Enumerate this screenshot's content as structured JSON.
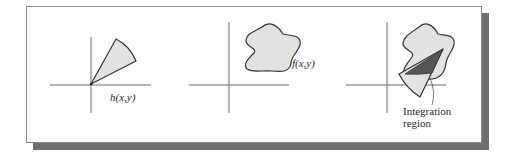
{
  "figure": {
    "panels": [
      {
        "id": "kernel",
        "label": "h(x,y)",
        "shape": "wedge"
      },
      {
        "id": "function",
        "label": "f(x,y)",
        "shape": "blob"
      },
      {
        "id": "integration",
        "label_line1": "Integration",
        "label_line2": "region",
        "shape": "blob-with-rotated-wedge-overlap"
      }
    ],
    "colors": {
      "fill_light": "#e2e2e2",
      "fill_dark": "#555555",
      "stroke": "#333333",
      "axis": "#6a6a6a",
      "shadow": "#6f6f6f",
      "frame_border": "#8a8a8a"
    }
  }
}
